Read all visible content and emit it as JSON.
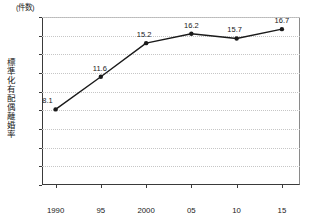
{
  "chart_data": {
    "type": "line",
    "title": "",
    "unit_caption": "(件数)",
    "ylabel": "標準化有配偶離婚率",
    "xlabel": "(年)",
    "categories": [
      "1990",
      "95",
      "2000",
      "05",
      "10",
      "15"
    ],
    "x": [
      1990,
      1995,
      2000,
      2005,
      2010,
      2015
    ],
    "values": [
      8.1,
      11.6,
      15.2,
      16.2,
      15.7,
      16.7
    ],
    "point_labels": [
      "8.1",
      "11.6",
      "15.2",
      "16.2",
      "15.7",
      "16.7"
    ],
    "ylim": [
      0,
      18
    ],
    "yticks": [
      0,
      2,
      4,
      6,
      8,
      10,
      12,
      14,
      16,
      18
    ],
    "ytick_labels": [
      "0",
      "2",
      "4",
      "6",
      "8",
      "10",
      "12",
      "14",
      "16",
      "18"
    ],
    "xlim": [
      1988.5,
      2017.0
    ],
    "grid": "horizontal-dotted",
    "legend": "none",
    "series_color": "#1a1a1a",
    "grid_color": "#c6c6c6",
    "axis_color": "#3a3a3a",
    "marker": "filled-circle"
  }
}
